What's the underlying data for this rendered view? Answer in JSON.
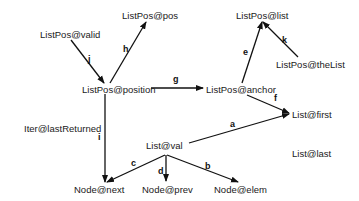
{
  "diagram": {
    "type": "directed-graph",
    "nodes": [
      {
        "id": "valid",
        "label": "ListPos@valid"
      },
      {
        "id": "pos",
        "label": "ListPos@pos"
      },
      {
        "id": "position",
        "label": "ListPos@position"
      },
      {
        "id": "list",
        "label": "ListPos@list"
      },
      {
        "id": "theList",
        "label": "ListPos@theList"
      },
      {
        "id": "anchor",
        "label": "ListPos@anchor"
      },
      {
        "id": "first",
        "label": "List@first"
      },
      {
        "id": "last",
        "label": "List@last"
      },
      {
        "id": "lastReturned",
        "label": "Iter@lastReturned"
      },
      {
        "id": "val",
        "label": "List@val"
      },
      {
        "id": "next",
        "label": "Node@next"
      },
      {
        "id": "prev",
        "label": "Node@prev"
      },
      {
        "id": "elem",
        "label": "Node@elem"
      }
    ],
    "edges": [
      {
        "id": "a",
        "label": "a",
        "from": "val",
        "to": "first"
      },
      {
        "id": "b",
        "label": "b",
        "from": "val",
        "to": "elem"
      },
      {
        "id": "c",
        "label": "c",
        "from": "val",
        "to": "next"
      },
      {
        "id": "d",
        "label": "d",
        "from": "val",
        "to": "prev"
      },
      {
        "id": "e",
        "label": "e",
        "from": "anchor",
        "to": "list"
      },
      {
        "id": "f",
        "label": "f",
        "from": "anchor",
        "to": "first"
      },
      {
        "id": "g",
        "label": "g",
        "from": "position",
        "to": "anchor"
      },
      {
        "id": "h",
        "label": "h",
        "from": "position",
        "to": "pos"
      },
      {
        "id": "i",
        "label": "i",
        "from": "position",
        "to": "next"
      },
      {
        "id": "j",
        "label": "j",
        "from": "valid",
        "to": "position"
      },
      {
        "id": "k",
        "label": "k",
        "from": "theList",
        "to": "list"
      }
    ]
  }
}
